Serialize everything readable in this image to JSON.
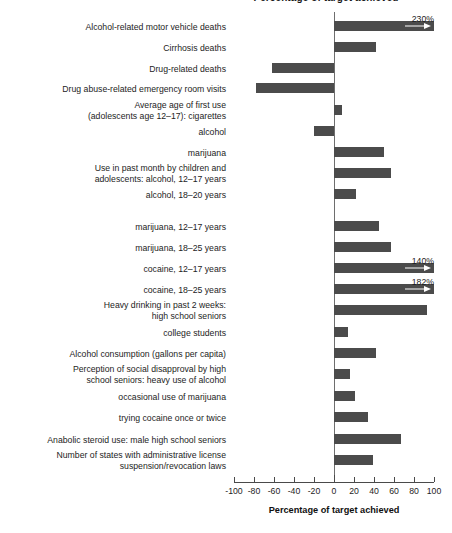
{
  "chart_data": {
    "type": "bar",
    "orientation": "horizontal",
    "title": "Percentage of target achieved",
    "xlabel": "Percentage of target achieved",
    "ylabel": "",
    "xlim": [
      -100,
      100
    ],
    "xticks": [
      -100,
      -80,
      -60,
      -40,
      -20,
      0,
      20,
      40,
      60,
      80,
      100
    ],
    "xtick_labels": [
      "-100",
      "-80",
      "-60",
      "-40",
      "-20",
      "0",
      "20",
      "40",
      "60",
      "80",
      "100"
    ],
    "grid": false,
    "legend": null,
    "bar_color": "#4b4b4b",
    "axis_color": "#4a4a4a",
    "categories": [
      "Alcohol-related motor vehicle deaths",
      "Cirrhosis deaths",
      "Drug-related deaths",
      "Drug abuse-related emergency room visits",
      "Average age of first use\n(adolescents age 12–17): cigarettes",
      "alcohol",
      "marijuana",
      "Use in past month by children and\nadolescents: alcohol, 12–17 years",
      "alcohol, 18–20 years",
      "marijuana, 12–17 years",
      "marijuana, 18–25 years",
      "cocaine, 12–17 years",
      "cocaine, 18–25 years",
      "Heavy drinking in past 2 weeks:\nhigh school seniors",
      "college students",
      "Alcohol consumption (gallons per capita)",
      "Perception of social disapproval by high\nschool seniors: heavy use of alcohol",
      "occasional use of marijuana",
      "trying cocaine once or twice",
      "Anabolic steroid use: male high school seniors",
      "Number of states with administrative license\nsuspension/revocation laws"
    ],
    "values": [
      230,
      42,
      -62,
      -78,
      8,
      -20,
      50,
      57,
      22,
      45,
      57,
      140,
      182,
      93,
      14,
      42,
      16,
      21,
      34,
      67,
      39
    ],
    "annotations": [
      {
        "category_index": 0,
        "label": "230%"
      },
      {
        "category_index": 11,
        "label": "140%"
      },
      {
        "category_index": 12,
        "label": "182%"
      }
    ],
    "clipped_bars": [
      0,
      11,
      12
    ]
  },
  "layout": {
    "label_rows": [
      {
        "top": 26,
        "lines": 1
      },
      {
        "top": 47,
        "lines": 1
      },
      {
        "top": 68,
        "lines": 1
      },
      {
        "top": 88,
        "lines": 1
      },
      {
        "top": 110,
        "lines": 2
      },
      {
        "top": 131,
        "lines": 1
      },
      {
        "top": 152,
        "lines": 1
      },
      {
        "top": 173,
        "lines": 2
      },
      {
        "top": 194,
        "lines": 1
      },
      {
        "top": 226,
        "lines": 1
      },
      {
        "top": 247,
        "lines": 1
      },
      {
        "top": 268,
        "lines": 1
      },
      {
        "top": 289,
        "lines": 1
      },
      {
        "top": 310,
        "lines": 2
      },
      {
        "top": 332,
        "lines": 1
      },
      {
        "top": 353,
        "lines": 1
      },
      {
        "top": 374,
        "lines": 2
      },
      {
        "top": 396,
        "lines": 1
      },
      {
        "top": 417,
        "lines": 1
      },
      {
        "top": 439,
        "lines": 1
      },
      {
        "top": 460,
        "lines": 2
      }
    ]
  }
}
